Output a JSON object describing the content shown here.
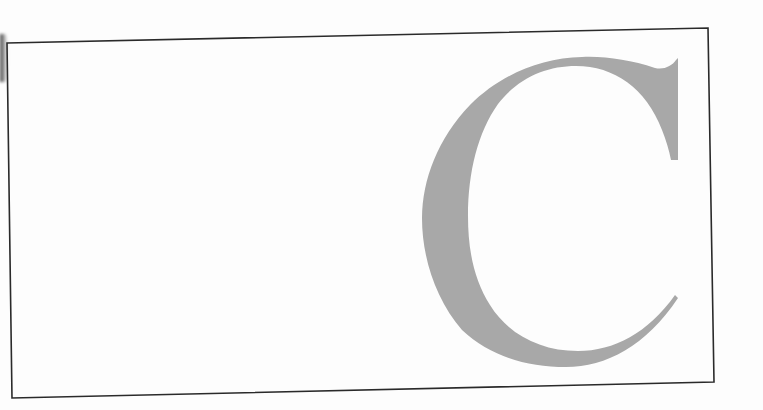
{
  "figure": {
    "letter": "C",
    "glyph_color": "#a8a8a8",
    "frame_color": "#2a2a2a",
    "background_color": "#ffffff"
  }
}
